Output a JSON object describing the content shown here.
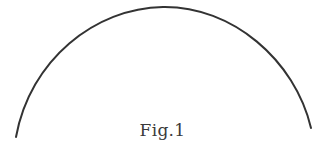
{
  "figure": {
    "caption": "Fig.1",
    "shape": "arc",
    "stroke_color": "#333333",
    "background": "#ffffff",
    "arc": {
      "start": [
        16,
        137
      ],
      "peak": [
        163,
        7
      ],
      "end": [
        311,
        128
      ]
    }
  }
}
